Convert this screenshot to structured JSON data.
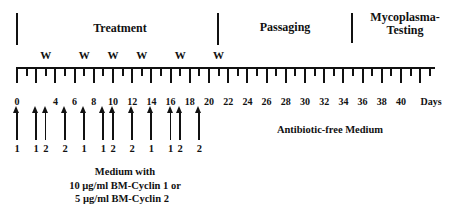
{
  "phases": [
    {
      "label": "Treatment",
      "start_day": 0,
      "end_day": 21
    },
    {
      "label": "Passaging",
      "start_day": 21,
      "end_day": 35
    },
    {
      "label": "Mycoplasma-\nTesting",
      "line1": "Mycoplasma-",
      "line2": "Testing",
      "start_day": 35
    }
  ],
  "axis": {
    "unit_label": "Days",
    "tick_labels": [
      "0",
      "4",
      "6",
      "8",
      "10",
      "12",
      "14",
      "16",
      "18",
      "20",
      "22",
      "24",
      "26",
      "28",
      "30",
      "32",
      "34",
      "36",
      "38",
      "40"
    ],
    "tick_label_days": [
      0,
      4,
      6,
      8,
      10,
      12,
      14,
      16,
      18,
      20,
      22,
      24,
      26,
      28,
      30,
      32,
      34,
      36,
      38,
      40
    ],
    "min_day": 0,
    "max_day": 43
  },
  "w_markers": {
    "label": "W",
    "days": [
      3,
      7,
      10,
      13,
      17,
      21
    ]
  },
  "treatments": [
    {
      "day": 0,
      "label": "1"
    },
    {
      "day": 2,
      "label": "1"
    },
    {
      "day": 3,
      "label": "2"
    },
    {
      "day": 5,
      "label": "2"
    },
    {
      "day": 7,
      "label": "1"
    },
    {
      "day": 9,
      "label": "1"
    },
    {
      "day": 10,
      "label": "2"
    },
    {
      "day": 12,
      "label": "2"
    },
    {
      "day": 14,
      "label": "1"
    },
    {
      "day": 16,
      "label": "1"
    },
    {
      "day": 17,
      "label": "2"
    },
    {
      "day": 19,
      "label": "2"
    }
  ],
  "notes": {
    "medium_line1": "Medium with",
    "medium_line2": "10 µg/ml BM-Cyclin 1 or",
    "medium_line3": "5 µg/ml BM-Cyclin 2",
    "antibiotic_free": "Antibiotic-free Medium"
  }
}
